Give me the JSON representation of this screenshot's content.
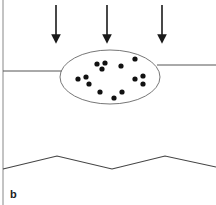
{
  "figure": {
    "panel_label": "b",
    "colors": {
      "stroke": "#555555",
      "arrow": "#1a1a1a",
      "dot": "#111111",
      "ellipse": "#777777"
    },
    "arrows": [
      {
        "x": 56,
        "y1": 5,
        "y2": 44
      },
      {
        "x": 107,
        "y1": 5,
        "y2": 44
      },
      {
        "x": 162,
        "y1": 5,
        "y2": 44
      }
    ],
    "ellipse": {
      "cx": 110,
      "cy": 77,
      "rx": 50,
      "ry": 27
    },
    "dots": [
      {
        "x": 97,
        "y": 64
      },
      {
        "x": 105,
        "y": 63
      },
      {
        "x": 102,
        "y": 69
      },
      {
        "x": 121,
        "y": 66
      },
      {
        "x": 135,
        "y": 59
      },
      {
        "x": 78,
        "y": 79
      },
      {
        "x": 86,
        "y": 77
      },
      {
        "x": 89,
        "y": 84
      },
      {
        "x": 100,
        "y": 92
      },
      {
        "x": 114,
        "y": 98
      },
      {
        "x": 122,
        "y": 92
      },
      {
        "x": 135,
        "y": 79
      },
      {
        "x": 143,
        "y": 76
      },
      {
        "x": 143,
        "y": 84
      }
    ]
  }
}
